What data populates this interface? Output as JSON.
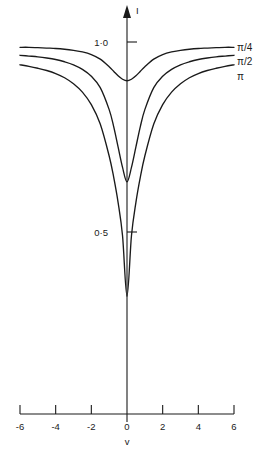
{
  "chart_data": {
    "type": "line",
    "title": "",
    "xlabel": "v",
    "ylabel": "I",
    "xlim": [
      -6,
      6
    ],
    "ylim": [
      0,
      1.05
    ],
    "grid": false,
    "legend_position": "right-of-curve-ends",
    "x_ticks": [
      {
        "value": -6,
        "label": "-6"
      },
      {
        "value": -4,
        "label": "-4"
      },
      {
        "value": -2,
        "label": "-2"
      },
      {
        "value": 0,
        "label": "0"
      },
      {
        "value": 2,
        "label": "2"
      },
      {
        "value": 4,
        "label": "4"
      },
      {
        "value": 6,
        "label": "6"
      }
    ],
    "y_ticks": [
      {
        "value": 1.0,
        "label": "1·0"
      },
      {
        "value": 0.5,
        "label": "0·5"
      }
    ],
    "x": [
      -6,
      -5.5,
      -5,
      -4.5,
      -4,
      -3.5,
      -3,
      -2.5,
      -2,
      -1.5,
      -1,
      -0.75,
      -0.5,
      -0.25,
      0,
      0.25,
      0.5,
      0.75,
      1,
      1.5,
      2,
      2.5,
      3,
      3.5,
      4,
      4.5,
      5,
      5.5,
      6
    ],
    "series": [
      {
        "name": "π/4",
        "label": "π/4",
        "values": [
          0.986,
          0.986,
          0.985,
          0.984,
          0.983,
          0.981,
          0.978,
          0.974,
          0.967,
          0.955,
          0.935,
          0.923,
          0.911,
          0.902,
          0.898,
          0.902,
          0.911,
          0.923,
          0.935,
          0.955,
          0.967,
          0.974,
          0.978,
          0.981,
          0.983,
          0.984,
          0.985,
          0.986,
          0.986
        ]
      },
      {
        "name": "π/2",
        "label": "π/2",
        "values": [
          0.965,
          0.963,
          0.961,
          0.958,
          0.954,
          0.948,
          0.94,
          0.928,
          0.91,
          0.88,
          0.822,
          0.778,
          0.724,
          0.67,
          0.632,
          0.67,
          0.724,
          0.778,
          0.822,
          0.88,
          0.91,
          0.928,
          0.94,
          0.948,
          0.954,
          0.958,
          0.961,
          0.963,
          0.965
        ]
      },
      {
        "name": "π",
        "label": "π",
        "values": [
          0.94,
          0.936,
          0.931,
          0.925,
          0.917,
          0.906,
          0.89,
          0.868,
          0.835,
          0.784,
          0.7,
          0.645,
          0.578,
          0.49,
          0.331,
          0.49,
          0.578,
          0.645,
          0.7,
          0.784,
          0.835,
          0.868,
          0.89,
          0.906,
          0.917,
          0.925,
          0.931,
          0.936,
          0.94
        ]
      }
    ]
  },
  "axes": {
    "y_axis_arrow_label": "I",
    "x_axis_label": "v"
  }
}
